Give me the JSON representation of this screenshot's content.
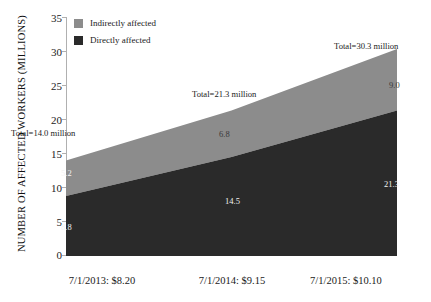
{
  "chart_data": {
    "type": "area",
    "title": "",
    "xlabel": "",
    "ylabel": "NUMBER OF AFFECTED WORKERS (MILLIONS)",
    "categories": [
      "7/1/2013: $8.20",
      "7/1/2014: $9.15",
      "7/1/2015: $10.10"
    ],
    "series": [
      {
        "name": "Directly affected",
        "values": [
          8.8,
          14.5,
          21.3
        ],
        "color": "#2a2a2a"
      },
      {
        "name": "Indirectly affected",
        "values": [
          5.2,
          6.8,
          9.0
        ],
        "color": "#8c8c8c"
      }
    ],
    "totals": [
      14.0,
      21.3,
      30.3
    ],
    "total_annotations": [
      "Total=14.0 million",
      "Total=21.3 million",
      "Total=30.3 million"
    ],
    "ylim": [
      0,
      35
    ],
    "yticks": [
      0,
      5,
      10,
      15,
      20,
      25,
      30,
      35
    ],
    "ytick_labels": [
      "0",
      "5",
      "10",
      "15",
      "20",
      "25",
      "30",
      "35"
    ],
    "grid": false,
    "stacked": true,
    "legend_position": "top-left"
  },
  "legend": {
    "items": [
      {
        "label": "Indirectly affected",
        "color": "#8c8c8c"
      },
      {
        "label": "Directly affected",
        "color": "#2a2a2a"
      }
    ]
  },
  "value_labels": {
    "indirect": [
      "5.2",
      "6.8",
      "9.0"
    ],
    "direct": [
      "8.8",
      "14.5",
      "21.3"
    ]
  },
  "colors": {
    "indirect": "#8c8c8c",
    "direct": "#2a2a2a",
    "axis": "#b0b0b0",
    "background": "#ffffff",
    "text": "#1a1a1a"
  }
}
